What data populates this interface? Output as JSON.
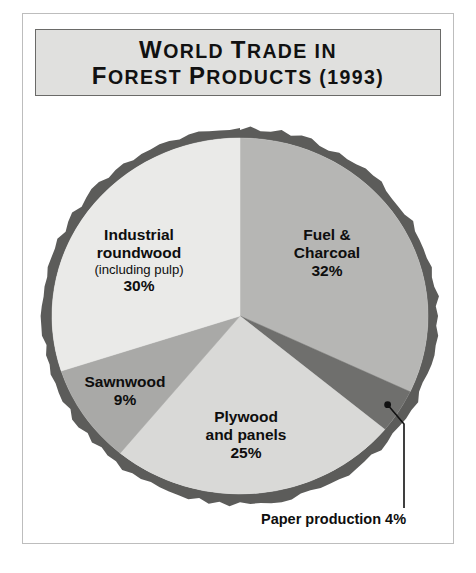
{
  "figure": {
    "background_color": "#ffffff",
    "frame_color": "#bdbdbd"
  },
  "title": {
    "line1_lead": "W",
    "line1_rest": "ORLD ",
    "line1_lead2": "T",
    "line1_rest2": "RADE IN",
    "line2_lead": "F",
    "line2_rest": "OREST ",
    "line2_lead2": "P",
    "line2_rest2": "RODUCTS (1993)",
    "full": "World Trade in Forest Products (1993)",
    "plate_color": "#e0e0de",
    "border_color": "#6a6a68"
  },
  "chart_data": {
    "type": "pie",
    "title": "World Trade in Forest Products (1993)",
    "xlabel": "",
    "ylabel": "",
    "legend_position": "none",
    "grid": false,
    "units": "percent",
    "start_angle_deg": 0,
    "direction": "clockwise",
    "categories": [
      "Fuel & Charcoal",
      "Paper production",
      "Plywood and panels",
      "Sawnwood",
      "Industrial roundwood (including pulp)"
    ],
    "values": [
      32,
      4,
      25,
      9,
      30
    ],
    "slices": [
      {
        "key": "fuel",
        "label_line1": "Fuel &",
        "label_line2": "Charcoal",
        "sublabel": "",
        "value": 32,
        "value_text": "32%",
        "color": "#b6b6b4",
        "start_deg": 0,
        "end_deg": 115.2
      },
      {
        "key": "paper",
        "label_line1": "Paper production 4%",
        "label_line2": "",
        "sublabel": "",
        "value": 4,
        "value_text": "4%",
        "color": "#6f6f6d",
        "start_deg": 115.2,
        "end_deg": 129.6,
        "callout": true
      },
      {
        "key": "plywood",
        "label_line1": "Plywood",
        "label_line2": "and panels",
        "sublabel": "",
        "value": 25,
        "value_text": "25%",
        "color": "#d9d9d7",
        "start_deg": 129.6,
        "end_deg": 219.6
      },
      {
        "key": "sawnwood",
        "label_line1": "Sawnwood",
        "label_line2": "",
        "sublabel": "",
        "value": 9,
        "value_text": "9%",
        "color": "#a9a9a7",
        "start_deg": 219.6,
        "end_deg": 252.0
      },
      {
        "key": "industrial",
        "label_line1": "Industrial",
        "label_line2": "roundwood",
        "sublabel": "(including pulp)",
        "value": 30,
        "value_text": "30%",
        "color": "#eaeae8",
        "start_deg": 252.0,
        "end_deg": 360.0
      }
    ],
    "ring_color": "#5c5c5a",
    "center_x": 240,
    "center_y": 316,
    "radius_x": 198,
    "radius_y": 188
  },
  "callout": {
    "text": "Paper production 4%",
    "line_color": "#111111",
    "dot_color": "#111111"
  }
}
